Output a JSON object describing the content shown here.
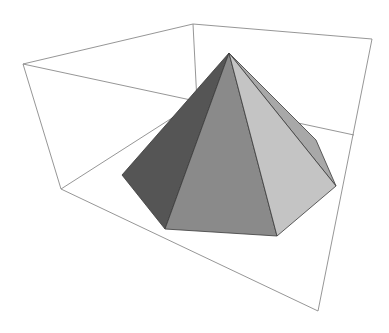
{
  "figure": {
    "type": "3d-polyhedron-plot",
    "width": 389,
    "height": 333,
    "background": "#ffffff"
  },
  "bounding_box": {
    "edge_color": "#8a8a8a",
    "edges": [
      {
        "name": "top-left-to-top-back",
        "from": [
          23,
          64
        ],
        "to": [
          193,
          24
        ]
      },
      {
        "name": "top-back-to-top-right",
        "from": [
          193,
          24
        ],
        "to": [
          372,
          39
        ]
      },
      {
        "name": "top-left-to-bottom-left",
        "from": [
          23,
          64
        ],
        "to": [
          61,
          189
        ]
      },
      {
        "name": "top-right-to-bottom-right",
        "from": [
          372,
          39
        ],
        "to": [
          318,
          311
        ]
      },
      {
        "name": "bottom-left-to-bottom-right",
        "from": [
          61,
          189
        ],
        "to": [
          318,
          311
        ]
      },
      {
        "name": "top-left-to-right-mid",
        "from": [
          23,
          64
        ],
        "to": [
          354,
          135
        ]
      },
      {
        "name": "top-back-to-hidden-corner",
        "from": [
          193,
          24
        ],
        "to": [
          197,
          102
        ]
      },
      {
        "name": "bottom-left-to-hidden-corner",
        "from": [
          61,
          189
        ],
        "to": [
          197,
          102
        ]
      }
    ]
  },
  "pyramid": {
    "apex": [
      229,
      53
    ],
    "base_vertices": [
      [
        122,
        175
      ],
      [
        165,
        229
      ],
      [
        277,
        236
      ],
      [
        336,
        186
      ],
      [
        316,
        140
      ]
    ],
    "faces": [
      {
        "name": "back-right-face",
        "points": [
          [
            229,
            53
          ],
          [
            316,
            140
          ],
          [
            336,
            186
          ]
        ],
        "fill": "#a8a8a8"
      },
      {
        "name": "left-face",
        "points": [
          [
            229,
            53
          ],
          [
            122,
            175
          ],
          [
            165,
            229
          ]
        ],
        "fill": "#555555"
      },
      {
        "name": "front-face",
        "points": [
          [
            229,
            53
          ],
          [
            165,
            229
          ],
          [
            277,
            236
          ]
        ],
        "fill": "#8a8a8a"
      },
      {
        "name": "right-face",
        "points": [
          [
            229,
            53
          ],
          [
            277,
            236
          ],
          [
            336,
            186
          ]
        ],
        "fill": "#c4c4c4"
      }
    ]
  }
}
